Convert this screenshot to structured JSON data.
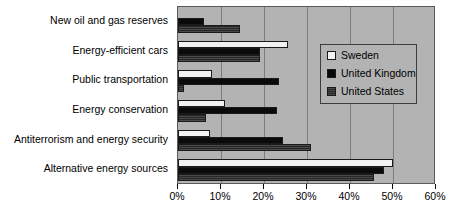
{
  "chart_data": {
    "type": "bar",
    "orientation": "horizontal",
    "title": "",
    "subtitle": "",
    "xlabel": "",
    "ylabel": "",
    "xlim": [
      0,
      60
    ],
    "xtick_labels": [
      "0%",
      "10%",
      "20%",
      "30%",
      "40%",
      "50%",
      "60%"
    ],
    "xtick_values": [
      0,
      10,
      20,
      30,
      40,
      50,
      60
    ],
    "grid": true,
    "legend_position": "inside-right",
    "categories": [
      "New oil and gas reserves",
      "Energy-efficient cars",
      "Public transportation",
      "Energy conservation",
      "Antiterrorism and energy security",
      "Alternative energy sources"
    ],
    "series": [
      {
        "name": "Sweden",
        "color": "#f2f2f2",
        "values": [
          0,
          25.5,
          8,
          11,
          7.5,
          50
        ]
      },
      {
        "name": "United Kingdom",
        "color": "#0a0a0a",
        "values": [
          6,
          19,
          23.5,
          23,
          24.5,
          48
        ]
      },
      {
        "name": "United States",
        "color": "#3d3d3d",
        "values": [
          14.5,
          19,
          1.5,
          6.5,
          31,
          45.5
        ]
      }
    ]
  },
  "legend": {
    "entries": [
      {
        "label": "Sweden",
        "swatch": "sweden-swatch-icon"
      },
      {
        "label": "United Kingdom",
        "swatch": "uk-swatch-icon"
      },
      {
        "label": "United States",
        "swatch": "us-swatch-icon"
      }
    ]
  }
}
